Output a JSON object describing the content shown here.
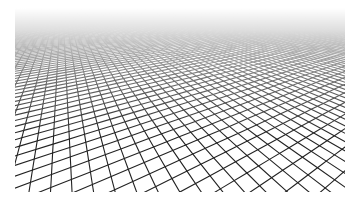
{
  "image": {
    "subject": "perspective grid receding into the distance",
    "description": "Black line grid in perspective on white background, fading to white toward the horizon",
    "colors": {
      "background": "#ffffff",
      "lines": "#222222"
    }
  }
}
